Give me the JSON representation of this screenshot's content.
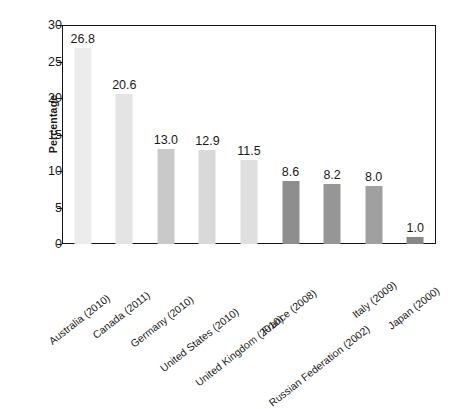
{
  "chart_data": {
    "type": "bar",
    "title": "",
    "subtitle": "",
    "xlabel": "",
    "ylabel": "Percentage",
    "ylim": [
      0,
      30
    ],
    "yticks": [
      0,
      5,
      10,
      15,
      20,
      25,
      30
    ],
    "ytick_labels": [
      "0",
      "5",
      "10",
      "15",
      "20",
      "25",
      "30"
    ],
    "grid": false,
    "legend": null,
    "categories": [
      "Australia (2010)",
      "Canada (2011)",
      "Germany (2010)",
      "United States (2010)",
      "United Kingdom (2010)",
      "France (2008)",
      "Russian Federation (2002)",
      "Italy (2009)",
      "Japan (2000)"
    ],
    "values": [
      26.8,
      20.6,
      13.0,
      12.9,
      11.5,
      8.6,
      8.2,
      8.0,
      1.0
    ],
    "value_labels": [
      "26.8",
      "20.6",
      "13.0",
      "12.9",
      "11.5",
      "8.6",
      "8.2",
      "8.0",
      "1.0"
    ],
    "bar_colors": [
      "#ececec",
      "#e4e4e4",
      "#c9c9c9",
      "#d9d9d9",
      "#dfdfdf",
      "#8e8e8e",
      "#969696",
      "#a0a0a0",
      "#878787"
    ],
    "axis_color": "#141414",
    "text_color": "#1a1a1a",
    "background_color": "#ffffff"
  }
}
